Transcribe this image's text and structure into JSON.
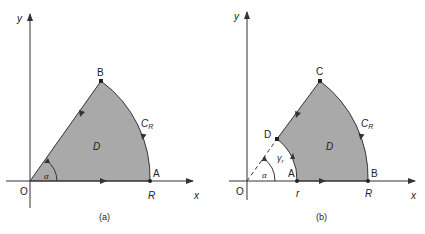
{
  "figures": [
    {
      "caption": "(a)",
      "axis_x": "x",
      "axis_y": "y",
      "origin": "O",
      "points": {
        "A": "A",
        "B": "B"
      },
      "radius_label": "R",
      "curve_label": "C",
      "curve_sub": "R",
      "region_label": "D",
      "angle_label": "α"
    },
    {
      "caption": "(b)",
      "axis_x": "x",
      "axis_y": "y",
      "origin": "O",
      "points": {
        "A": "A",
        "B": "B",
        "C": "C",
        "D": "D"
      },
      "inner_radius_label": "r",
      "radius_label": "R",
      "curve_label": "C",
      "curve_sub": "R",
      "inner_curve_label": "γ",
      "inner_curve_sub": "r",
      "region_label": "D",
      "angle_label": "α"
    }
  ],
  "colors": {
    "fill": "#a9a9a9",
    "line": "#333333"
  }
}
